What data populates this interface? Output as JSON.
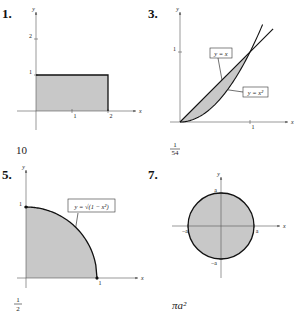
{
  "colors": {
    "fill": "#c8c8c8",
    "curve": "#111111",
    "axis": "#555555",
    "text": "#222222"
  },
  "chart_data": [
    {
      "type": "area",
      "number": "1.",
      "xlabel": "x",
      "ylabel": "y",
      "xlim": [
        0,
        2.5
      ],
      "ylim": [
        -0.5,
        2.8
      ],
      "xticks": [
        {
          "v": 1,
          "label": "1"
        },
        {
          "v": 2,
          "label": "2"
        }
      ],
      "yticks": [
        {
          "v": 1,
          "label": "1"
        },
        {
          "v": 2,
          "label": "2"
        }
      ],
      "region": "rectangle 0<=x<=2, 0<=y<=1",
      "rect": {
        "x0": 0,
        "x1": 2,
        "y0": 0,
        "y1": 1
      },
      "labels": [],
      "answer": "10"
    },
    {
      "type": "area",
      "number": "3.",
      "xlabel": "x",
      "ylabel": "y",
      "xlim": [
        0,
        1.4
      ],
      "ylim": [
        0,
        1.5
      ],
      "xticks": [
        {
          "v": 1,
          "label": "1"
        }
      ],
      "yticks": [
        {
          "v": 1,
          "label": "1"
        }
      ],
      "curves": [
        {
          "name": "y = x",
          "fn": "x",
          "x_range": [
            0,
            1.33
          ]
        },
        {
          "name": "y = x²",
          "fn": "x^2",
          "x_range": [
            0,
            1.18
          ]
        }
      ],
      "region": "between y=x and y=x² for 0<=x<=1",
      "labels": [
        {
          "text": "y = x",
          "points_to": [
            0.6,
            0.6
          ]
        },
        {
          "text": "y = x²",
          "points_to": [
            0.68,
            0.46
          ]
        }
      ],
      "answer_num": "1",
      "answer_den": "54"
    },
    {
      "type": "area",
      "number": "5.",
      "xlabel": "x",
      "ylabel": "y",
      "xlim": [
        0,
        1.6
      ],
      "ylim": [
        0,
        1.3
      ],
      "xticks": [
        {
          "v": 1,
          "label": "1"
        }
      ],
      "yticks": [
        {
          "v": 1,
          "label": "1"
        }
      ],
      "curves": [
        {
          "name": "y = √(1 − x²)",
          "fn": "sqrt(1-x^2)",
          "x_range": [
            0,
            1
          ]
        }
      ],
      "region": "under y=sqrt(1-x^2) for 0<=x<=1",
      "labels": [
        {
          "text": "y = √(1 − x²)",
          "points_to": [
            0.7,
            0.71
          ]
        }
      ],
      "points": [
        [
          0,
          1
        ],
        [
          1,
          0
        ]
      ],
      "answer_num": "1",
      "answer_den": "2"
    },
    {
      "type": "area",
      "number": "7.",
      "xlabel": "x",
      "ylabel": "y",
      "xlim": [
        -1.4,
        1.4
      ],
      "ylim": [
        -1.6,
        1.6
      ],
      "xticks": [
        {
          "v": -1,
          "label": "−a"
        },
        {
          "v": 1,
          "label": "a"
        }
      ],
      "yticks": [
        {
          "v": -1,
          "label": "−a"
        },
        {
          "v": 1,
          "label": "a"
        }
      ],
      "region": "disk x²+y²<=a²",
      "circle": {
        "cx": 0,
        "cy": 0,
        "r": 1
      },
      "labels": [],
      "answer": "πa²"
    }
  ]
}
